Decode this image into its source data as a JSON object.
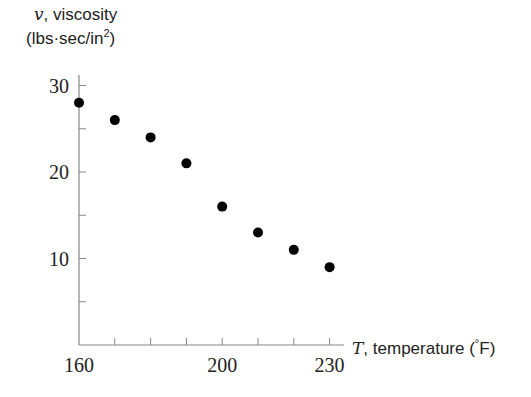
{
  "chart_data": {
    "type": "scatter",
    "title": "",
    "xlabel": "T, temperature (°F)",
    "ylabel": "v, viscosity (lbs·sec/in²)",
    "x": [
      160,
      170,
      180,
      190,
      200,
      210,
      220,
      230
    ],
    "series": [
      {
        "name": "viscosity",
        "values": [
          28,
          26,
          24,
          21,
          16,
          13,
          11,
          9
        ]
      }
    ],
    "xlim": [
      160,
      232
    ],
    "ylim": [
      0,
      31
    ],
    "x_ticks": [
      160,
      170,
      180,
      190,
      200,
      210,
      220,
      230
    ],
    "x_tick_labels": [
      "160",
      "",
      "",
      "",
      "200",
      "",
      "",
      "230"
    ],
    "y_ticks": [
      5,
      10,
      15,
      20,
      25,
      30
    ],
    "y_tick_labels": [
      "",
      "10",
      "",
      "20",
      "",
      "30"
    ],
    "grid": false,
    "legend": null,
    "marker_color": "#000000"
  },
  "labels": {
    "y_var": "v",
    "y_name": ", viscosity",
    "y_units_open": "(lbs·sec/in",
    "y_units_sup": "2",
    "y_units_close": ")",
    "x_var": "T",
    "x_name": ", temperature (",
    "x_units_sup": "°",
    "x_units_close": "F)"
  }
}
